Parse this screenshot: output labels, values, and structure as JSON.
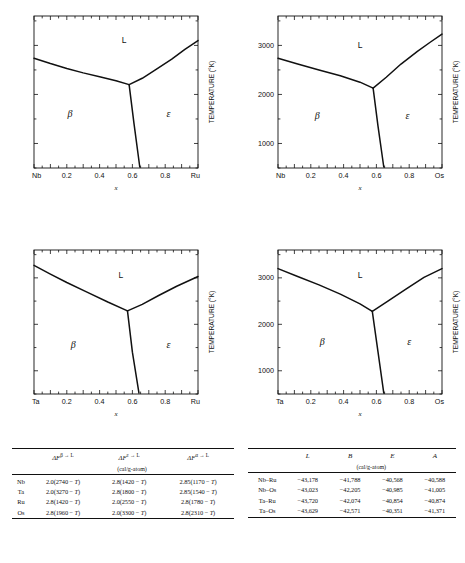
{
  "chart_data": [
    {
      "type": "line",
      "title": "Nb-Ru phase diagram",
      "xlabel": "x",
      "ylabel": "TEMPERATURE (°K)",
      "xlim": [
        0,
        1
      ],
      "ylim": [
        500,
        3600
      ],
      "xticklabels": [
        "Nb",
        "0.2",
        "0.4",
        "0.6",
        "0.8",
        "Ru"
      ],
      "xtickvals": [
        0,
        0.2,
        0.4,
        0.6,
        0.8,
        1.0
      ],
      "yticklabels": [],
      "ytickvals": [
        1000,
        2000,
        3000
      ],
      "show_ytick_labels": false,
      "show_ylabel": true,
      "grid": false,
      "region_labels": [
        {
          "text": "L",
          "x": 0.55,
          "y": 3050
        },
        {
          "text": "β",
          "x": 0.22,
          "y": 1550
        },
        {
          "text": "ε",
          "x": 0.82,
          "y": 1550
        }
      ],
      "series": [
        {
          "name": "beta-liquidus",
          "x": [
            0.0,
            0.1,
            0.2,
            0.3,
            0.4,
            0.5,
            0.58
          ],
          "y": [
            2740,
            2630,
            2530,
            2440,
            2360,
            2280,
            2200
          ]
        },
        {
          "name": "epsilon-liquidus",
          "x": [
            0.58,
            0.66,
            0.74,
            0.84,
            0.92,
            1.0
          ],
          "y": [
            2200,
            2330,
            2500,
            2720,
            2920,
            3100
          ]
        },
        {
          "name": "eutectic-boundary",
          "x": [
            0.58,
            0.61,
            0.645
          ],
          "y": [
            2200,
            1400,
            520
          ]
        }
      ]
    },
    {
      "type": "line",
      "title": "Nb-Os phase diagram",
      "xlabel": "x",
      "ylabel": "TEMPERATURE (°K)",
      "xlim": [
        0,
        1
      ],
      "ylim": [
        500,
        3600
      ],
      "xticklabels": [
        "Nb",
        "0.2",
        "0.4",
        "0.6",
        "0.8",
        "Os"
      ],
      "xtickvals": [
        0,
        0.2,
        0.4,
        0.6,
        0.8,
        1.0
      ],
      "yticklabels": [
        "1000",
        "2000",
        "3000"
      ],
      "ytickvals": [
        1000,
        2000,
        3000
      ],
      "show_ytick_labels": true,
      "show_ylabel": true,
      "grid": false,
      "region_labels": [
        {
          "text": "L",
          "x": 0.5,
          "y": 2950
        },
        {
          "text": "β",
          "x": 0.24,
          "y": 1500
        },
        {
          "text": "ε",
          "x": 0.79,
          "y": 1500
        }
      ],
      "series": [
        {
          "name": "beta-liquidus",
          "x": [
            0.0,
            0.12,
            0.25,
            0.38,
            0.5,
            0.58
          ],
          "y": [
            2740,
            2620,
            2500,
            2380,
            2250,
            2130
          ]
        },
        {
          "name": "epsilon-liquidus",
          "x": [
            0.58,
            0.66,
            0.75,
            0.85,
            0.93,
            1.0
          ],
          "y": [
            2130,
            2350,
            2620,
            2880,
            3070,
            3230
          ]
        },
        {
          "name": "eutectic-boundary",
          "x": [
            0.58,
            0.61,
            0.645
          ],
          "y": [
            2130,
            1350,
            520
          ]
        }
      ]
    },
    {
      "type": "line",
      "title": "Ta-Ru phase diagram",
      "xlabel": "x",
      "ylabel": "TEMPERATURE (°K)",
      "xlim": [
        0,
        1
      ],
      "ylim": [
        500,
        3600
      ],
      "xticklabels": [
        "Ta",
        "0.2",
        "0.4",
        "0.6",
        "0.8",
        "Ru"
      ],
      "xtickvals": [
        0,
        0.2,
        0.4,
        0.6,
        0.8,
        1.0
      ],
      "yticklabels": [],
      "ytickvals": [
        1000,
        2000,
        3000
      ],
      "show_ytick_labels": false,
      "show_ylabel": true,
      "grid": false,
      "region_labels": [
        {
          "text": "L",
          "x": 0.53,
          "y": 3000
        },
        {
          "text": "β",
          "x": 0.24,
          "y": 1500
        },
        {
          "text": "ε",
          "x": 0.82,
          "y": 1500
        }
      ],
      "series": [
        {
          "name": "beta-liquidus",
          "x": [
            0.0,
            0.1,
            0.2,
            0.32,
            0.45,
            0.57
          ],
          "y": [
            3270,
            3080,
            2900,
            2700,
            2480,
            2290
          ]
        },
        {
          "name": "epsilon-liquidus",
          "x": [
            0.57,
            0.66,
            0.76,
            0.87,
            1.0
          ],
          "y": [
            2290,
            2430,
            2620,
            2820,
            3030
          ]
        },
        {
          "name": "eutectic-boundary",
          "x": [
            0.57,
            0.6,
            0.64
          ],
          "y": [
            2290,
            1400,
            520
          ]
        }
      ]
    },
    {
      "type": "line",
      "title": "Ta-Os phase diagram",
      "xlabel": "x",
      "ylabel": "TEMPERATURE (°K)",
      "xlim": [
        0,
        1
      ],
      "ylim": [
        500,
        3600
      ],
      "xticklabels": [
        "Ta",
        "0.2",
        "0.4",
        "0.6",
        "0.8",
        "Os"
      ],
      "xtickvals": [
        0,
        0.2,
        0.4,
        0.6,
        0.8,
        1.0
      ],
      "yticklabels": [
        "1000",
        "2000",
        "3000"
      ],
      "ytickvals": [
        1000,
        2000,
        3000
      ],
      "show_ytick_labels": true,
      "show_ylabel": true,
      "grid": false,
      "region_labels": [
        {
          "text": "L",
          "x": 0.5,
          "y": 3000
        },
        {
          "text": "β",
          "x": 0.27,
          "y": 1550
        },
        {
          "text": "ε",
          "x": 0.8,
          "y": 1550
        }
      ],
      "series": [
        {
          "name": "beta-liquidus",
          "x": [
            0.0,
            0.12,
            0.25,
            0.38,
            0.5,
            0.575
          ],
          "y": [
            3200,
            3030,
            2850,
            2650,
            2440,
            2280
          ]
        },
        {
          "name": "epsilon-liquidus",
          "x": [
            0.575,
            0.67,
            0.78,
            0.89,
            1.0
          ],
          "y": [
            2280,
            2500,
            2760,
            3010,
            3200
          ]
        },
        {
          "name": "eutectic-boundary",
          "x": [
            0.575,
            0.61,
            0.645
          ],
          "y": [
            2280,
            1400,
            520
          ]
        }
      ]
    }
  ],
  "table_left": {
    "headers": [
      "",
      "ΔFβ→L",
      "ΔFε→L",
      "ΔFα→L"
    ],
    "header_base": "ΔF",
    "header_supers": [
      "β → L",
      "ε → L",
      "α → L"
    ],
    "units": "(cal/g-atom)",
    "rows": [
      {
        "label": "Nb",
        "values": [
          "2.0(2740 − T)",
          "2.8(1420 − T)",
          "2.85(1170 − T)"
        ]
      },
      {
        "label": "Ta",
        "values": [
          "2.0(3270 − T)",
          "2.8(1800 − T)",
          "2.85(1540 − T)"
        ]
      },
      {
        "label": "Ru",
        "values": [
          "2.8(1420 − T)",
          "2.0(2550 − T)",
          "2.8(1780 − T)"
        ]
      },
      {
        "label": "Os",
        "values": [
          "2.8(1960 − T)",
          "2.0(3300 − T)",
          "2.8(2310 − T)"
        ]
      }
    ]
  },
  "table_right": {
    "headers": [
      "",
      "L",
      "B",
      "E",
      "A"
    ],
    "units": "(cal/g-atom)",
    "rows": [
      {
        "label": "Nb–Ru",
        "values": [
          "−43,178",
          "−41,788",
          "−40,568",
          "−40,588"
        ]
      },
      {
        "label": "Nb–Os",
        "values": [
          "−43,023",
          "−42,205",
          "−40,985",
          "−41,005"
        ]
      },
      {
        "label": "Ta–Ru",
        "values": [
          "−43,720",
          "−42,074",
          "−40,854",
          "−40,874"
        ]
      },
      {
        "label": "Ta–Os",
        "values": [
          "−43,629",
          "−42,571",
          "−40,351",
          "−41,371"
        ]
      }
    ]
  }
}
